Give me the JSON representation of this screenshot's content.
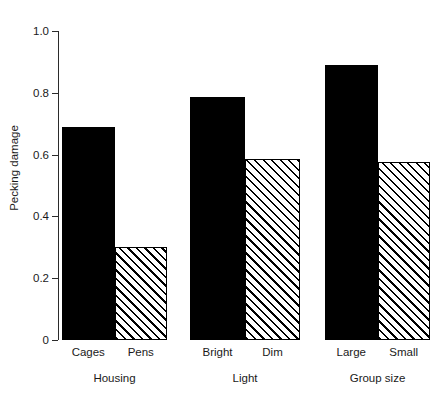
{
  "chart_data": {
    "type": "bar",
    "title": "",
    "xlabel": "",
    "ylabel": "Pecking damage",
    "ylim": [
      0,
      1.0
    ],
    "grid": false,
    "legend": "none",
    "y_ticks": [
      "0",
      "0.2",
      "0.4",
      "0.6",
      "0.8",
      "1.0"
    ],
    "y_tick_values": [
      0,
      0.2,
      0.4,
      0.6,
      0.8,
      1.0
    ],
    "groups": [
      {
        "name": "Housing",
        "categories": [
          "Cages",
          "Pens"
        ],
        "values": [
          0.69,
          0.3
        ],
        "fills": [
          "solid",
          "hatched"
        ]
      },
      {
        "name": "Light",
        "categories": [
          "Bright",
          "Dim"
        ],
        "values": [
          0.785,
          0.585
        ],
        "fills": [
          "solid",
          "hatched"
        ]
      },
      {
        "name": "Group size",
        "categories": [
          "Large",
          "Small"
        ],
        "values": [
          0.89,
          0.575
        ],
        "fills": [
          "solid",
          "hatched"
        ]
      }
    ],
    "categories": [
      "Cages",
      "Pens",
      "Bright",
      "Dim",
      "Large",
      "Small"
    ],
    "values": [
      0.69,
      0.3,
      0.785,
      0.585,
      0.89,
      0.575
    ],
    "colors": {
      "solid_fill": "#000000",
      "hatch_fill": "#ffffff",
      "hatch_line": "#000000",
      "outline": "#000000",
      "axis": "#2b2b2b",
      "background": "#ffffff",
      "text": "#1a1a1a"
    }
  }
}
